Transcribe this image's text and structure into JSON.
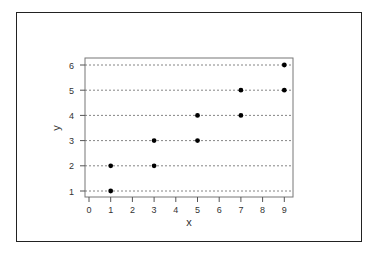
{
  "chart_data": {
    "type": "scatter",
    "title": "",
    "xlabel": "x",
    "ylabel": "y",
    "xlim": [
      0,
      9
    ],
    "ylim": [
      1,
      6
    ],
    "x_ticks": [
      "0",
      "1",
      "2",
      "3",
      "4",
      "5",
      "6",
      "7",
      "8",
      "9"
    ],
    "y_ticks": [
      "1",
      "2",
      "3",
      "4",
      "5",
      "6"
    ],
    "grid": "horizontal dotted lines at each y tick",
    "legend": null,
    "points": [
      {
        "x": 1,
        "y": 1
      },
      {
        "x": 1,
        "y": 2
      },
      {
        "x": 3,
        "y": 2
      },
      {
        "x": 3,
        "y": 3
      },
      {
        "x": 5,
        "y": 3
      },
      {
        "x": 5,
        "y": 4
      },
      {
        "x": 7,
        "y": 4
      },
      {
        "x": 7,
        "y": 5
      },
      {
        "x": 9,
        "y": 5
      },
      {
        "x": 9,
        "y": 6
      }
    ]
  }
}
